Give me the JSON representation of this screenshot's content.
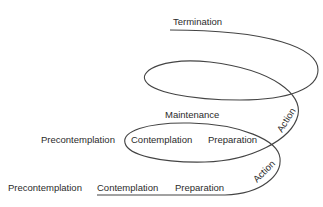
{
  "diagram": {
    "stages": {
      "termination": "Termination",
      "maintenance": "Maintenance",
      "level2": {
        "precontemplation": "Precontemplation",
        "contemplation": "Contemplation",
        "preparation": "Preparation",
        "action": "Action"
      },
      "level1": {
        "precontemplation": "Precontemplation",
        "contemplation": "Contemplation",
        "preparation": "Preparation",
        "action": "Action"
      }
    },
    "colors": {
      "line": "#444444",
      "text": "#2b2b2b",
      "background": "#ffffff"
    }
  }
}
